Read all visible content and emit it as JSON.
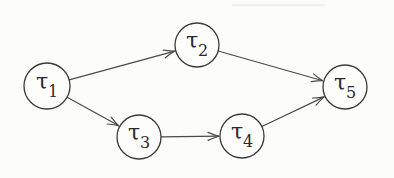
{
  "diagram": {
    "type": "directed-acyclic-graph",
    "nodes": [
      {
        "id": "t1",
        "symbol": "τ",
        "subscript": "1",
        "cx": 47,
        "cy": 86,
        "r": 23
      },
      {
        "id": "t2",
        "symbol": "τ",
        "subscript": "2",
        "cx": 197,
        "cy": 45,
        "r": 22
      },
      {
        "id": "t3",
        "symbol": "τ",
        "subscript": "3",
        "cx": 139,
        "cy": 137,
        "r": 22
      },
      {
        "id": "t4",
        "symbol": "τ",
        "subscript": "4",
        "cx": 242,
        "cy": 136,
        "r": 22
      },
      {
        "id": "t5",
        "symbol": "τ",
        "subscript": "5",
        "cx": 345,
        "cy": 87,
        "r": 22
      }
    ],
    "edges": [
      {
        "from": "t1",
        "to": "t2"
      },
      {
        "from": "t1",
        "to": "t3"
      },
      {
        "from": "t3",
        "to": "t4"
      },
      {
        "from": "t2",
        "to": "t5"
      },
      {
        "from": "t4",
        "to": "t5"
      }
    ],
    "colors": {
      "stroke": "#3a3a3a",
      "edge": "#4a4a4a",
      "background": "#fcfcfb",
      "text": "#2a2a2a"
    }
  }
}
